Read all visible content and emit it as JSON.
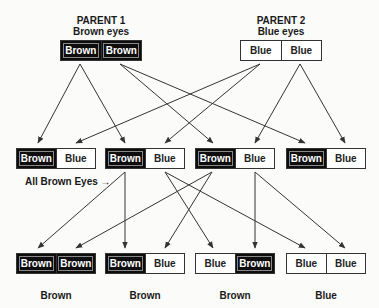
{
  "parents": [
    {
      "title": "PARENT 1",
      "subtitle": "Brown eyes",
      "alleles": [
        "Brown",
        "Brown"
      ],
      "x": 60,
      "y": 40,
      "w": 82,
      "cx": 101
    },
    {
      "title": "PARENT 2",
      "subtitle": "Blue eyes",
      "alleles": [
        "Blue",
        "Blue"
      ],
      "x": 240,
      "y": 40,
      "w": 82,
      "cx": 281
    }
  ],
  "generation1": [
    {
      "alleles": [
        "Brown",
        "Blue"
      ],
      "x": 16,
      "y": 148,
      "w": 80
    },
    {
      "alleles": [
        "Brown",
        "Blue"
      ],
      "x": 105,
      "y": 148,
      "w": 80
    },
    {
      "alleles": [
        "Brown",
        "Blue"
      ],
      "x": 195,
      "y": 148,
      "w": 80
    },
    {
      "alleles": [
        "Brown",
        "Blue"
      ],
      "x": 286,
      "y": 148,
      "w": 80
    }
  ],
  "generation1_note": "All Brown Eyes",
  "generation2": [
    {
      "alleles": [
        "Brown",
        "Brown"
      ],
      "x": 16,
      "y": 253,
      "w": 80,
      "phenotype": "Brown"
    },
    {
      "alleles": [
        "Brown",
        "Blue"
      ],
      "x": 105,
      "y": 253,
      "w": 80,
      "phenotype": "Brown"
    },
    {
      "alleles": [
        "Blue",
        "Brown"
      ],
      "x": 195,
      "y": 253,
      "w": 80,
      "phenotype": "Brown"
    },
    {
      "alleles": [
        "Blue",
        "Blue"
      ],
      "x": 286,
      "y": 253,
      "w": 80,
      "phenotype": "Blue"
    }
  ],
  "arrows": [
    [
      80,
      64,
      38,
      143
    ],
    [
      80,
      64,
      125,
      143
    ],
    [
      120,
      64,
      213,
      143
    ],
    [
      120,
      64,
      305,
      143
    ],
    [
      260,
      64,
      76,
      143
    ],
    [
      260,
      64,
      165,
      143
    ],
    [
      300,
      64,
      255,
      143
    ],
    [
      300,
      64,
      345,
      143
    ],
    [
      125,
      172,
      38,
      248
    ],
    [
      125,
      172,
      125,
      248
    ],
    [
      165,
      172,
      213,
      248
    ],
    [
      165,
      172,
      305,
      248
    ],
    [
      212,
      172,
      76,
      248
    ],
    [
      212,
      172,
      165,
      248
    ],
    [
      255,
      172,
      255,
      248
    ],
    [
      255,
      172,
      345,
      248
    ]
  ],
  "colors": {
    "brown_allele": "#0d0d0d",
    "blue_allele": "#ffffff",
    "line": "#333333"
  }
}
